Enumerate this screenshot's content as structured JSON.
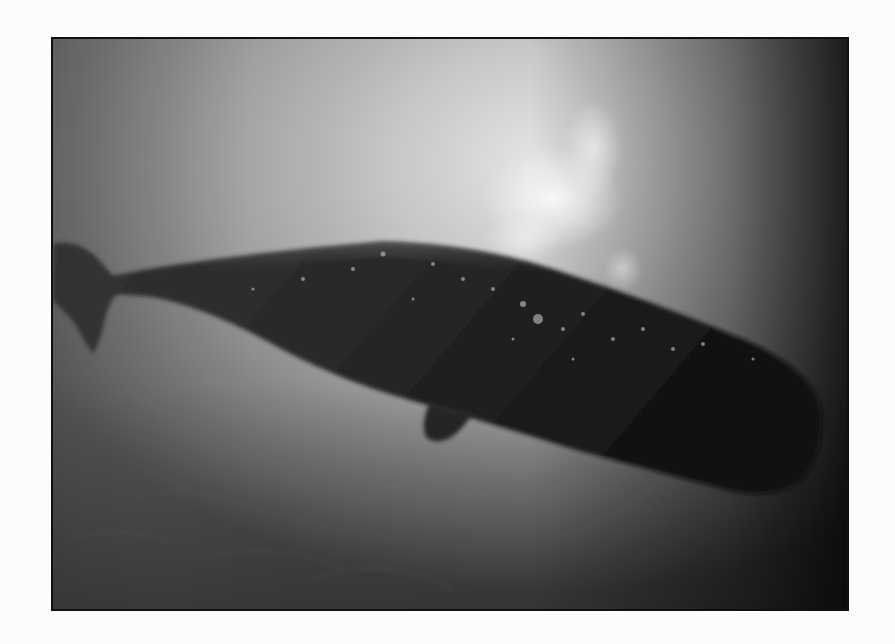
{
  "image": {
    "subject": "Sperm whale silhouetted underwater seen from below",
    "alt": "Underwater photograph of a sperm whale swimming near the sunlit surface",
    "style": "grayscale photograph with thin dark border on white background"
  },
  "colors": {
    "page_background": "#fcfcfc",
    "frame_border": "#111111",
    "water_light": "#cfcfcf",
    "water_mid": "#9a9a9a",
    "water_dark": "#3a3a3a",
    "whale_body": "#1c1c1c"
  }
}
